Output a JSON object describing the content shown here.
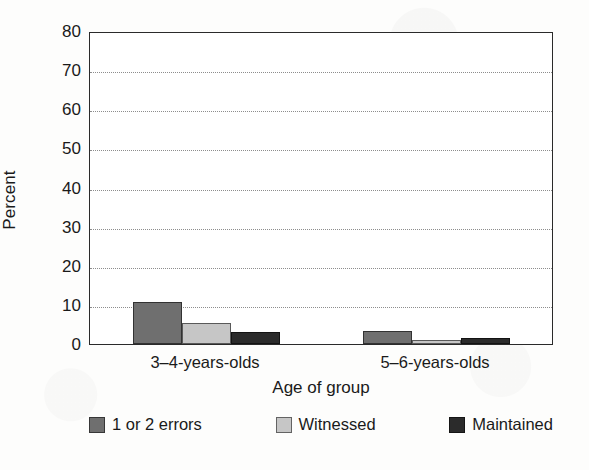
{
  "chart_data": {
    "type": "bar",
    "title": "",
    "xlabel": "Age of group",
    "ylabel": "Percent",
    "categories": [
      "3–4-years-olds",
      "5–6-years-olds"
    ],
    "series": [
      {
        "name": "1 or 2 errors",
        "values": [
          10.7,
          3.3
        ],
        "color": "#6f6f6f"
      },
      {
        "name": "Witnessed",
        "values": [
          5.4,
          1.0
        ],
        "color": "#c6c6c6"
      },
      {
        "name": "Maintained",
        "values": [
          3.0,
          1.5
        ],
        "color": "#2b2b2b"
      }
    ],
    "ylim": [
      0,
      80
    ],
    "ytick_values": [
      0,
      10,
      20,
      30,
      40,
      50,
      60,
      70,
      80
    ],
    "ytick_labels": [
      "0",
      "10",
      "20",
      "30",
      "40",
      "50",
      "60",
      "70",
      "80"
    ],
    "grid": true,
    "grid_style": "dotted-horizontal",
    "legend_position": "bottom",
    "background_color": "#ffffff",
    "axis_color": "#2a2a2a"
  }
}
